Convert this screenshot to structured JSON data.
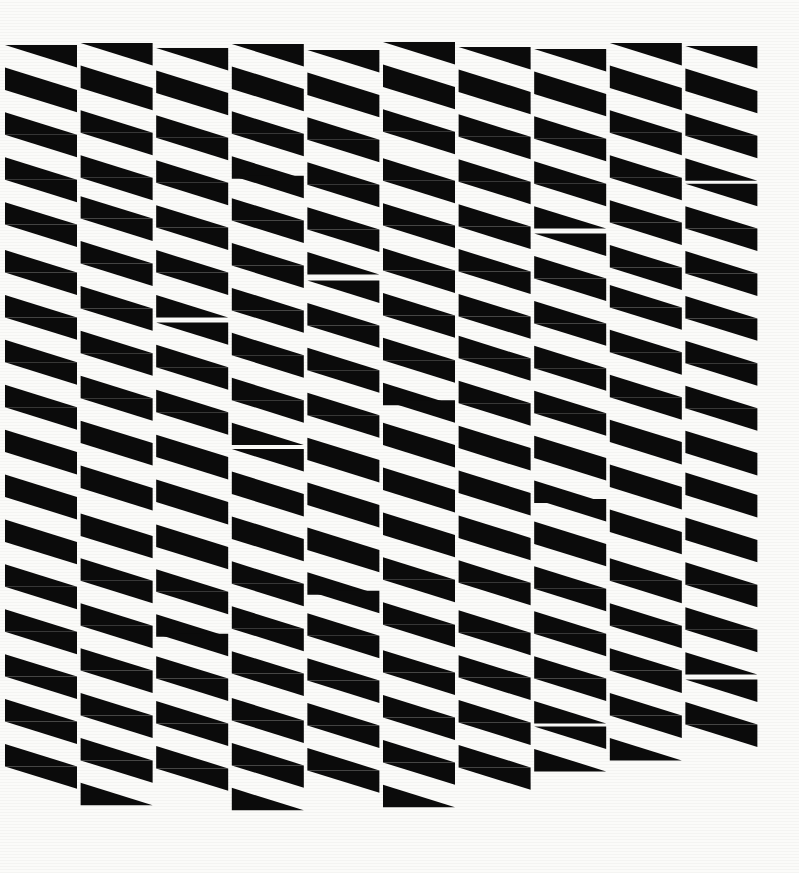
{
  "artwork": {
    "title": "Untitled Op-Art Triangle Grid",
    "medium": "black and white geometric print",
    "canvas": {
      "width": 799,
      "height": 873,
      "background_color": "#fbfbf9",
      "ink_color": "#0b0b0b"
    },
    "composition": {
      "type": "tessellated-triangle-grid",
      "columns": 10,
      "rows": 34,
      "column_pitch": 75.6,
      "row_pitch": 22.45,
      "grid_origin_x": 5,
      "grid_origin_y": 45,
      "cell_width": 72,
      "cell_height": 22.45,
      "description": "Ten vertical columns of stacked black right triangles whose hypotenuses alternate direction row by row, producing a zig-zag chevron rhythm. Individual columns are offset vertically by small irregular amounts, fracturing the horizontal bands and leaving a ragged bottom edge."
    },
    "column_offsets": [
      0,
      -2,
      3,
      -1,
      5,
      -3,
      2,
      4,
      -2,
      1
    ],
    "column_breaks": [
      [
        9,
        3
      ],
      [
        7,
        -4,
        21,
        3
      ],
      [
        12,
        5,
        26,
        -3
      ],
      [
        6,
        -3,
        18,
        4,
        29,
        2
      ],
      [
        10,
        6,
        24,
        -4
      ],
      [
        5,
        4,
        16,
        -5,
        27,
        3
      ],
      [
        13,
        -3,
        25,
        5
      ],
      [
        8,
        5,
        20,
        -4,
        30,
        3
      ],
      [
        11,
        -5,
        23,
        4
      ],
      [
        6,
        3,
        19,
        -3,
        28,
        5
      ]
    ],
    "column_bottom_rows": [
      33,
      34,
      33,
      34,
      33,
      34,
      33,
      32,
      32,
      31
    ]
  },
  "labels": {
    "canvas_name": "artwork-canvas",
    "pattern_name": "triangle-tessellation"
  }
}
